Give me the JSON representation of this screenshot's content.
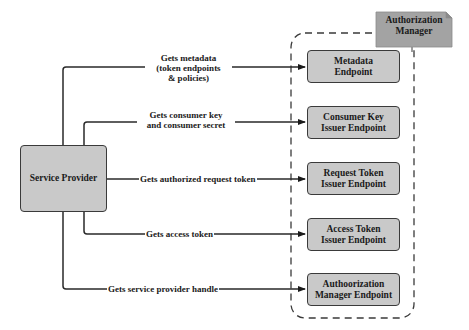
{
  "manager": {
    "label": "Authorization Manager",
    "label_line1": "Authorization",
    "label_line2": "Manager",
    "fill": "#a3a3a3"
  },
  "source": {
    "label": "Service Provider",
    "fill": "#c9c9c9"
  },
  "endpoints": [
    {
      "line1": "Metadata",
      "line2": "Endpoint"
    },
    {
      "line1": "Consumer Key",
      "line2": "Issuer Endpoint"
    },
    {
      "line1": "Request Token",
      "line2": "Issuer Endpoint"
    },
    {
      "line1": "Access Token",
      "line2": "Issuer Endpoint"
    },
    {
      "line1": "Authoorization",
      "line2": "Manager Endpoint"
    }
  ],
  "edges": [
    {
      "line1": "Gets  metadata",
      "line2": "(token endpoints",
      "line3": "& policies)"
    },
    {
      "line1": "Gets consumer key",
      "line2": "and consumer secret"
    },
    {
      "line1": "Gets authorized request token"
    },
    {
      "line1": "Gets access token"
    },
    {
      "line1": "Gets service provider handle"
    }
  ],
  "colors": {
    "stroke": "#2a2a2a",
    "endpoint_fill": "#c9c9c9",
    "manager_fill": "#a3a3a3"
  }
}
